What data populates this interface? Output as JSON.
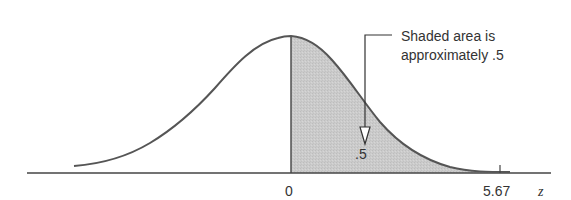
{
  "diagram": {
    "type": "normal-distribution-curve",
    "annotation_line1": "Shaded area is",
    "annotation_line2": "approximately .5",
    "area_label": ".5",
    "axis": {
      "label": "z",
      "ticks": [
        {
          "label": "0"
        },
        {
          "label": "5.67"
        }
      ]
    },
    "colors": {
      "curve": "#555555",
      "shade": "#c8c8c8",
      "axis": "#444444",
      "text": "#333333"
    }
  }
}
